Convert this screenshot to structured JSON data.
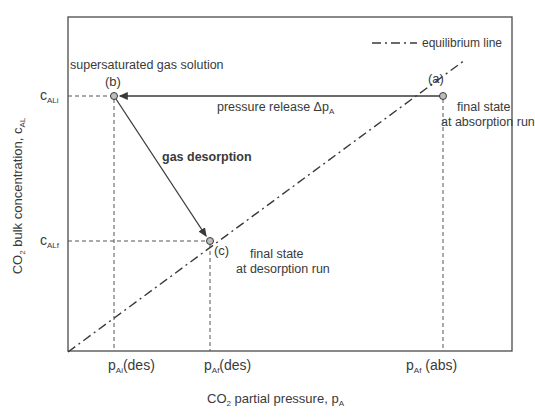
{
  "diagram": {
    "title": "",
    "axes": {
      "x": {
        "label_main": "CO",
        "label_sub": "2",
        "label_rest": " partial pressure, p",
        "label_sub2": "A"
      },
      "y": {
        "label_main": "CO",
        "label_sub": "2",
        "label_rest": " bulk concentration, c",
        "label_sub2": "AL"
      }
    },
    "x_ticks": [
      {
        "main": "p",
        "sub": "Ai",
        "rest": "(des)"
      },
      {
        "main": "p",
        "sub": "Af",
        "rest": "(des)"
      },
      {
        "main": "p",
        "sub": "Af",
        "rest": " (abs)"
      }
    ],
    "y_ticks": [
      {
        "main": "c",
        "sub": "ALi"
      },
      {
        "main": "c",
        "sub": "ALf"
      }
    ],
    "points": [
      {
        "id": "a",
        "label": "(a)",
        "annotation_line1": "final state",
        "annotation_line2": "at absorption run"
      },
      {
        "id": "b",
        "label": "(b)",
        "annotation_line1": "supersaturated gas solution"
      },
      {
        "id": "c",
        "label": "(c)",
        "annotation_line1": "final state",
        "annotation_line2": "at desorption run"
      }
    ],
    "arrows": [
      {
        "from": "a",
        "to": "b",
        "label_main": "pressure release Δp",
        "label_sub": "A"
      },
      {
        "from": "b",
        "to": "c",
        "label": "gas desorption"
      }
    ],
    "legend": {
      "entries": [
        {
          "style": "dash-dot",
          "label": "equilibrium line"
        }
      ]
    },
    "colors": {
      "line": "#3a3a3a",
      "frame": "#4a4a4a",
      "point_fill": "#bdbdbd"
    }
  }
}
